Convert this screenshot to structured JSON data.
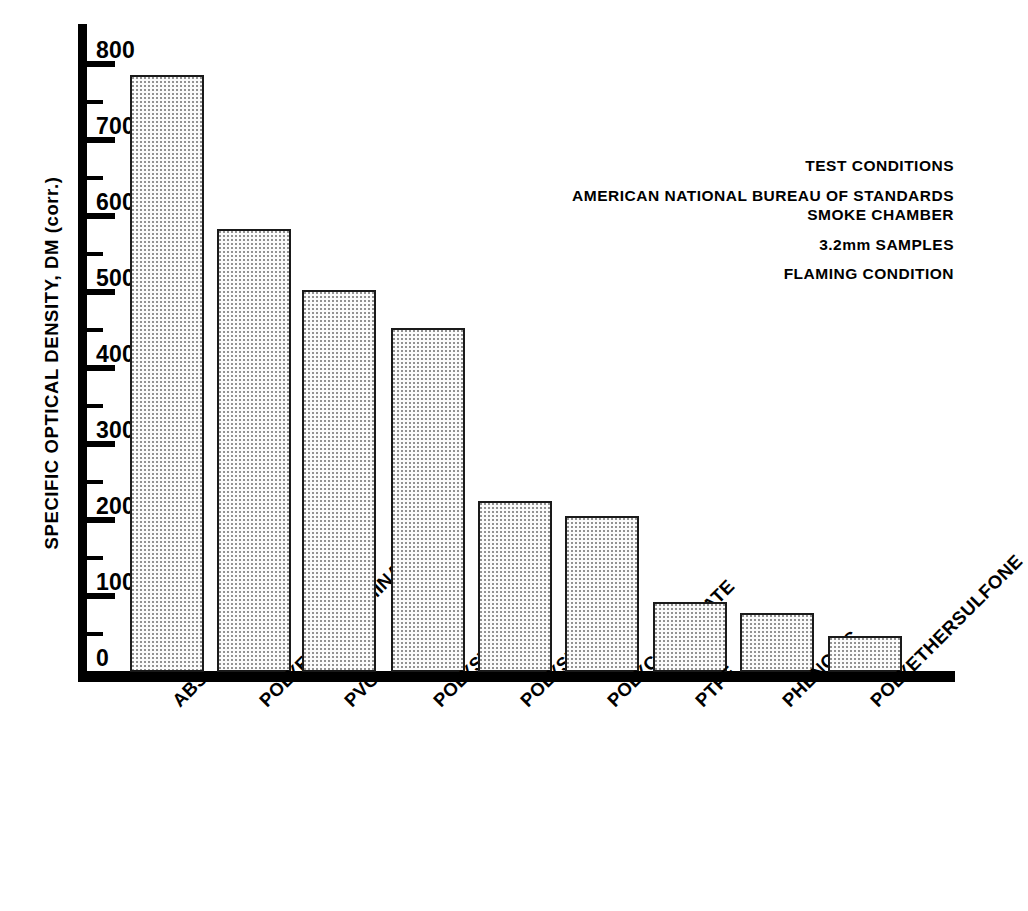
{
  "chart_data": {
    "type": "bar",
    "title": "",
    "subtitle": "",
    "xlabel": "",
    "ylabel": "SPECIFIC OPTICAL DENSITY, DM (corr.)",
    "ylim": [
      0,
      820
    ],
    "yticks": [
      0,
      100,
      200,
      300,
      400,
      500,
      600,
      700,
      800
    ],
    "ytick_labels": [
      "0",
      "100",
      "200",
      "300",
      "400",
      "500",
      "600",
      "700",
      "800"
    ],
    "minor_ticks": [
      50,
      150,
      250,
      350,
      450,
      550,
      650,
      750
    ],
    "grid": false,
    "legend": null,
    "categories": [
      "ABS",
      "POLYESTER LAMINATE",
      "PVC",
      "POLYSTYRENE",
      "POLYSULFONE",
      "POLYCARBONATE",
      "PTFE",
      "PHENOLIC",
      "POLYETHERSULFONE"
    ],
    "values": [
      785,
      583,
      502,
      452,
      225,
      205,
      92,
      78,
      47
    ],
    "bar_fill": "#fbfbfb",
    "bar_edge": "#1a1a1a",
    "annotations": [
      "TEST CONDITIONS",
      "AMERICAN NATIONAL BUREAU OF STANDARDS",
      "SMOKE CHAMBER",
      "3.2mm SAMPLES",
      "FLAMING CONDITION"
    ]
  },
  "axis": {
    "y_label": "SPECIFIC OPTICAL DENSITY, DM (corr.)"
  },
  "annotation": {
    "line1": "TEST CONDITIONS",
    "line2": "AMERICAN NATIONAL BUREAU OF STANDARDS",
    "line3": "SMOKE CHAMBER",
    "line4": "3.2mm SAMPLES",
    "line5": "FLAMING CONDITION"
  }
}
